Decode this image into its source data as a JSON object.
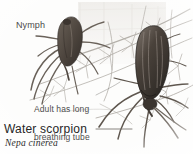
{
  "figure": {
    "background_color": "#fdfdfc",
    "body_color": "#554c45",
    "body_dark_color": "#3a3430",
    "twig_color": "#b0aca6",
    "leader_color": "#6e6a66"
  },
  "annotations": {
    "nymph_label": "Nymph",
    "adult_label_line1": "Adult has long",
    "adult_label_line2": "breathing tube"
  },
  "caption": {
    "common_name": "Water scorpion",
    "scientific_name": "Nepa cinerea"
  }
}
